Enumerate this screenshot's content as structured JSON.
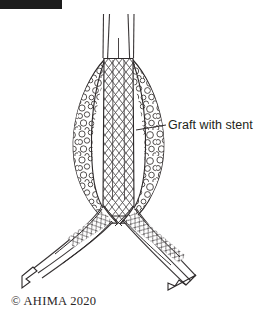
{
  "figure": {
    "background_color": "#ffffff",
    "line_color": "#231f20",
    "width": 264,
    "height": 321
  },
  "redaction": {
    "name": "black-bar",
    "color": "#1c1c1c"
  },
  "annotations": {
    "graft_label": "Graft with stent"
  },
  "credit": {
    "copyright": "© AHIMA 2020"
  },
  "anatomy": {
    "aorta_label": "aorta",
    "aneurysm_sac_label": "aneurysm sac with thrombus",
    "stent_graft_label": "stent graft",
    "left_iliac_label": "left iliac artery",
    "right_iliac_label": "right iliac artery",
    "flow_arrow_label": "blood flow direction"
  }
}
